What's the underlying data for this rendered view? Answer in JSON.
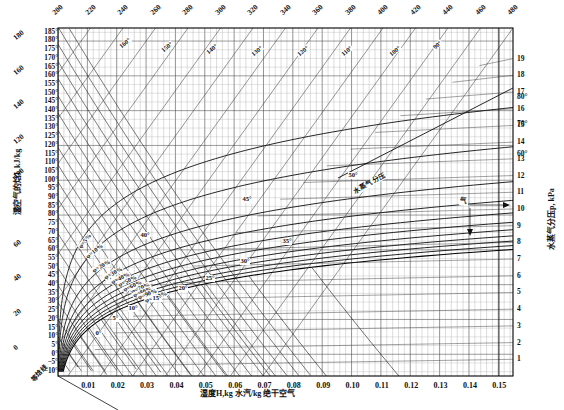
{
  "chart_data": {
    "type": "line",
    "xlabel": "湿度H,kg 水汽/kg 绝干空气",
    "ylabel": "湿空气的焓I, kJ/kg",
    "y2label": "水蒸气分压p, kPa",
    "xlim": [
      0,
      0.155
    ],
    "grid": true,
    "legend_position": "inline-curve-labels",
    "x_ticks": [
      "0.01",
      "0.02",
      "0.03",
      "0.04",
      "0.05",
      "0.06",
      "0.07",
      "0.08",
      "0.09",
      "0.10",
      "0.11",
      "0.12",
      "0.13",
      "0.14",
      "0.15"
    ],
    "x_tick_values": [
      0.01,
      0.02,
      0.03,
      0.04,
      0.05,
      0.06,
      0.07,
      0.08,
      0.09,
      0.1,
      0.11,
      0.12,
      0.13,
      0.14,
      0.15
    ],
    "top_ticks": [
      "200",
      "220",
      "240",
      "260",
      "280",
      "300",
      "320",
      "340",
      "360",
      "380",
      "400",
      "420",
      "440",
      "460",
      "480"
    ],
    "top_tick_values": [
      200,
      220,
      240,
      260,
      280,
      300,
      320,
      340,
      360,
      380,
      400,
      420,
      440,
      460,
      480
    ],
    "right_ticks": [
      "1",
      "2",
      "3",
      "4",
      "5",
      "6",
      "7",
      "8",
      "9",
      "10",
      "11",
      "12",
      "13",
      "14",
      "15",
      "16",
      "17",
      "18",
      "19"
    ],
    "right_tick_values": [
      1,
      2,
      3,
      4,
      5,
      6,
      7,
      8,
      9,
      10,
      11,
      12,
      13,
      14,
      15,
      16,
      17,
      18,
      19
    ],
    "left_temp_ticks": [
      "185°",
      "180°",
      "175°",
      "170°",
      "165°",
      "160°",
      "155°",
      "150°",
      "145°",
      "140°",
      "135°",
      "130°",
      "125°",
      "120°",
      "115°",
      "110°",
      "105°",
      "100°",
      "95°",
      "90°",
      "85°",
      "80°",
      "75°",
      "70°",
      "65°",
      "60°",
      "55°",
      "50°",
      "45°",
      "40°",
      "35°",
      "30°",
      "25°",
      "20°",
      "15°",
      "10°",
      "5°",
      "0°",
      "−5°",
      "−10°"
    ],
    "left_temp_values": [
      185,
      180,
      175,
      170,
      165,
      160,
      155,
      150,
      145,
      140,
      135,
      130,
      125,
      120,
      115,
      110,
      105,
      100,
      95,
      90,
      85,
      80,
      75,
      70,
      65,
      60,
      55,
      50,
      45,
      40,
      35,
      30,
      25,
      20,
      15,
      10,
      5,
      0,
      -5,
      -10
    ],
    "enthalpy_ticks": [
      "180",
      "160",
      "140",
      "120",
      "100",
      "80",
      "60",
      "40",
      "20",
      "0"
    ],
    "enthalpy_values": [
      180,
      160,
      140,
      120,
      100,
      80,
      60,
      40,
      20,
      0
    ],
    "inner_enthalpy_labels": [
      "160°",
      "150°",
      "140°",
      "130°",
      "120°",
      "110°",
      "100°",
      "90°"
    ],
    "right_temp_labels": [
      "80°",
      "70°",
      "60°"
    ],
    "right_temp_values": [
      80,
      70,
      60
    ],
    "humidity_curves": [
      {
        "label": "φ=5%",
        "value": 5
      },
      {
        "label": "φ=10%",
        "value": 10
      },
      {
        "label": "φ=20%",
        "value": 20
      },
      {
        "label": "φ=30%",
        "value": 30
      },
      {
        "label": "φ=40%",
        "value": 40
      },
      {
        "label": "φ=50%",
        "value": 50
      },
      {
        "label": "φ=60%",
        "value": 60
      },
      {
        "label": "φ=70%",
        "value": 70
      },
      {
        "label": "φ=80%",
        "value": 80
      },
      {
        "label": "φ=90%",
        "value": 90
      },
      {
        "label": "φ=100%",
        "value": 100
      }
    ],
    "wet_bulb_labels": [
      "0°",
      "5°",
      "10°",
      "15°",
      "20°",
      "25°",
      "30°",
      "35°",
      "40°",
      "45°",
      "50°"
    ],
    "wet_bulb_values": [
      0,
      5,
      10,
      15,
      20,
      25,
      30,
      35,
      40,
      45,
      50
    ],
    "annotations": [
      {
        "text": "水蒸气分压",
        "kind": "vapor-pressure-line-label"
      },
      {
        "text": "气",
        "kind": "arrow-callout"
      },
      {
        "text": "等焓线",
        "kind": "corner-note"
      }
    ]
  },
  "axes": {
    "left_title": "湿空气的焓I, kJ/kg",
    "bottom_title": "湿度H,kg 水汽/kg 绝干空气",
    "right_title": "水蒸气分压p, kPa",
    "corner_note": "等焓线"
  }
}
